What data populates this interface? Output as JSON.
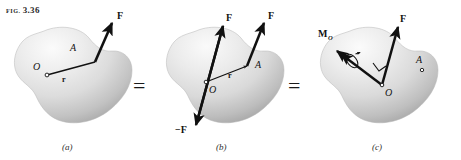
{
  "figure": {
    "label_prefix": "FIG.",
    "label_number": "3.36",
    "full_label": "FIG. 3.36",
    "background_color": "#ffffff",
    "ink_color": "#141414",
    "body_fill_light": "#f2f2f2",
    "body_fill_mid": "#d8d8d8",
    "body_fill_dark": "#9a9a9a"
  },
  "operators": [
    {
      "name": "equals-1",
      "symbol": "="
    },
    {
      "name": "equals-2",
      "symbol": "="
    }
  ],
  "panels": [
    {
      "id": "a",
      "caption": "(a)",
      "description": "Force F applied at point A of a rigid body, position vector r from O to A",
      "labels": {
        "force": "F",
        "point_o": "O",
        "point_a": "A",
        "position_vector": "r"
      },
      "vectors": [
        {
          "name": "force-F",
          "symbol": "F",
          "applied_at": "A",
          "sense": "up-right"
        },
        {
          "name": "position-r",
          "symbol": "r",
          "from": "O",
          "to": "A"
        }
      ],
      "points": [
        {
          "name": "point-O",
          "symbol": "O"
        },
        {
          "name": "point-A",
          "symbol": "A"
        }
      ]
    },
    {
      "id": "b",
      "caption": "(b)",
      "description": "Equal and opposite forces F and -F added at O; original F remains at A",
      "labels": {
        "force_at_a": "F",
        "force_at_o": "F",
        "force_negative": "−F",
        "point_o": "O",
        "point_a": "A",
        "position_vector": "r"
      },
      "vectors": [
        {
          "name": "force-F-at-A",
          "symbol": "F",
          "applied_at": "A",
          "sense": "up-right"
        },
        {
          "name": "force-F-at-O",
          "symbol": "F",
          "applied_at": "O",
          "sense": "up-right"
        },
        {
          "name": "force-minus-F-at-O",
          "symbol": "−F",
          "applied_at": "O",
          "sense": "down-left"
        },
        {
          "name": "position-r",
          "symbol": "r",
          "from": "O",
          "to": "A"
        }
      ],
      "points": [
        {
          "name": "point-O",
          "symbol": "O"
        },
        {
          "name": "point-A",
          "symbol": "A"
        }
      ]
    },
    {
      "id": "c",
      "caption": "(c)",
      "description": "Force F moved to O plus moment M_O represented by a double-headed vector perpendicular to F",
      "labels": {
        "force": "F",
        "moment": "M",
        "moment_subscript": "O",
        "moment_full": "Mₒ",
        "point_o": "O",
        "point_a": "A",
        "right_angle": "∟"
      },
      "vectors": [
        {
          "name": "force-F-at-O",
          "symbol": "F",
          "applied_at": "O",
          "sense": "up-right"
        },
        {
          "name": "moment-MO",
          "symbol": "M",
          "subscript": "O",
          "applied_at": "O",
          "sense": "up-left",
          "style": "double-headed-with-curl"
        }
      ],
      "points": [
        {
          "name": "point-O",
          "symbol": "O"
        },
        {
          "name": "point-A",
          "symbol": "A"
        }
      ],
      "annotations": [
        {
          "name": "right-angle-mark",
          "symbol": "∟"
        }
      ]
    }
  ]
}
